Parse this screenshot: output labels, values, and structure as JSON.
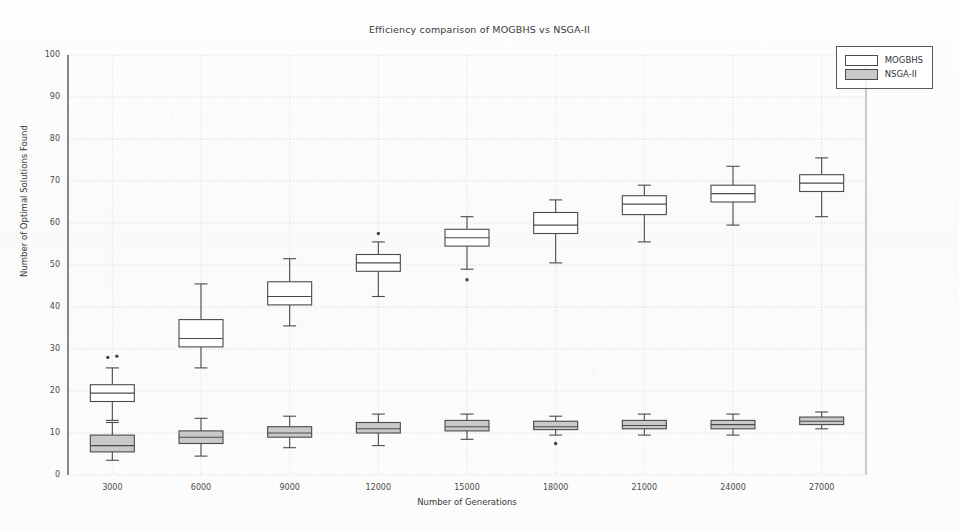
{
  "chart_data": {
    "type": "box",
    "title": "Efficiency comparison of MOGBHS vs NSGA-II",
    "xlabel": "Number of Generations",
    "ylabel": "Number of Optimal Solutions Found",
    "categories": [
      "3000",
      "6000",
      "9000",
      "12000",
      "15000",
      "18000",
      "21000",
      "24000",
      "27000"
    ],
    "ylim": [
      0,
      100
    ],
    "yticks": [
      0,
      10,
      20,
      30,
      40,
      50,
      60,
      70,
      80,
      90,
      100
    ],
    "grid": true,
    "legend_position": "top-right",
    "series": [
      {
        "name": "MOGBHS",
        "fill": "#ffffff",
        "edge": "#4a4a4a",
        "boxes": [
          {
            "category": "3000",
            "whisker_low": 13.0,
            "q1": 17.5,
            "median": 19.5,
            "q3": 21.5,
            "whisker_high": 25.5,
            "outliers": [
              28.0,
              28.3
            ]
          },
          {
            "category": "6000",
            "whisker_low": 25.5,
            "q1": 30.5,
            "median": 32.5,
            "q3": 37.0,
            "whisker_high": 45.5,
            "outliers": []
          },
          {
            "category": "9000",
            "whisker_low": 35.5,
            "q1": 40.5,
            "median": 42.5,
            "q3": 46.0,
            "whisker_high": 51.5,
            "outliers": []
          },
          {
            "category": "12000",
            "whisker_low": 42.5,
            "q1": 48.5,
            "median": 50.5,
            "q3": 52.5,
            "whisker_high": 55.5,
            "outliers": [
              57.5
            ]
          },
          {
            "category": "15000",
            "whisker_low": 49.0,
            "q1": 54.5,
            "median": 56.5,
            "q3": 58.5,
            "whisker_high": 61.5,
            "outliers": [
              46.5
            ]
          },
          {
            "category": "18000",
            "whisker_low": 50.5,
            "q1": 57.5,
            "median": 59.5,
            "q3": 62.5,
            "whisker_high": 65.5,
            "outliers": []
          },
          {
            "category": "21000",
            "whisker_low": 55.5,
            "q1": 62.0,
            "median": 64.5,
            "q3": 66.5,
            "whisker_high": 69.0,
            "outliers": []
          },
          {
            "category": "24000",
            "whisker_low": 59.5,
            "q1": 65.0,
            "median": 67.0,
            "q3": 69.0,
            "whisker_high": 73.5,
            "outliers": []
          },
          {
            "category": "27000",
            "whisker_low": 61.5,
            "q1": 67.5,
            "median": 69.5,
            "q3": 71.5,
            "whisker_high": 75.5,
            "outliers": []
          }
        ]
      },
      {
        "name": "NSGA-II",
        "fill": "#c9c9c9",
        "edge": "#4a4a4a",
        "boxes": [
          {
            "category": "3000",
            "whisker_low": 3.5,
            "q1": 5.5,
            "median": 7.0,
            "q3": 9.5,
            "whisker_high": 12.5,
            "outliers": []
          },
          {
            "category": "6000",
            "whisker_low": 4.5,
            "q1": 7.5,
            "median": 9.0,
            "q3": 10.5,
            "whisker_high": 13.5,
            "outliers": []
          },
          {
            "category": "9000",
            "whisker_low": 6.5,
            "q1": 9.0,
            "median": 10.0,
            "q3": 11.5,
            "whisker_high": 14.0,
            "outliers": []
          },
          {
            "category": "12000",
            "whisker_low": 7.0,
            "q1": 10.0,
            "median": 11.0,
            "q3": 12.5,
            "whisker_high": 14.5,
            "outliers": []
          },
          {
            "category": "15000",
            "whisker_low": 8.5,
            "q1": 10.5,
            "median": 11.5,
            "q3": 13.0,
            "whisker_high": 14.5,
            "outliers": []
          },
          {
            "category": "18000",
            "whisker_low": 9.5,
            "q1": 10.8,
            "median": 11.5,
            "q3": 12.8,
            "whisker_high": 14.0,
            "outliers": [
              7.5
            ]
          },
          {
            "category": "21000",
            "whisker_low": 9.5,
            "q1": 11.0,
            "median": 11.8,
            "q3": 13.0,
            "whisker_high": 14.5,
            "outliers": []
          },
          {
            "category": "24000",
            "whisker_low": 9.5,
            "q1": 11.0,
            "median": 12.0,
            "q3": 13.0,
            "whisker_high": 14.5,
            "outliers": []
          },
          {
            "category": "27000",
            "whisker_low": 11.0,
            "q1": 12.0,
            "median": 12.8,
            "q3": 13.8,
            "whisker_high": 15.0,
            "outliers": []
          }
        ]
      }
    ]
  },
  "legend": {
    "entries": [
      {
        "label": "MOGBHS"
      },
      {
        "label": "NSGA-II"
      }
    ]
  },
  "plot": {
    "left": 68,
    "right": 866,
    "top": 55,
    "bottom": 475
  }
}
